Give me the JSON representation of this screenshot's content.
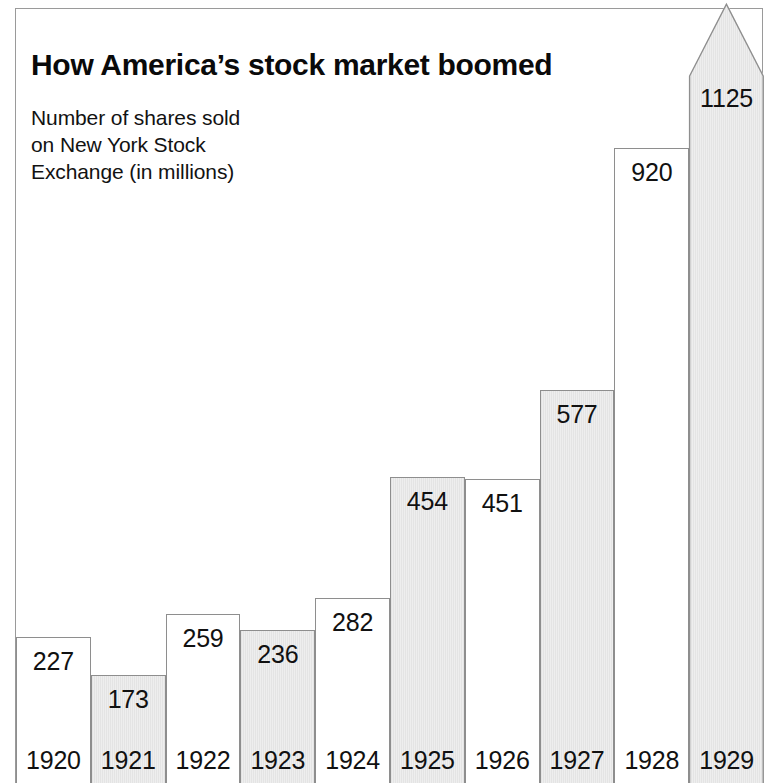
{
  "title": "How America’s stock market boomed",
  "subtitle_lines": [
    "Number of shares sold",
    "on New York Stock",
    "Exchange (in millions)"
  ],
  "colors": {
    "frame_border": "#9a9a9a",
    "bar_border": "#8e8e8e",
    "bar_light_fill": "#ffffff",
    "bar_shaded_fill": "#e9e9e9",
    "text": "#111111",
    "background": "#ffffff"
  },
  "chart_data": {
    "type": "bar",
    "title": "How America’s stock market boomed",
    "subtitle": "Number of shares sold on New York Stock Exchange (in millions)",
    "xlabel": "",
    "ylabel": "Number of shares sold (millions)",
    "ylim": [
      0,
      1125
    ],
    "grid": false,
    "legend": "none",
    "categories": [
      "1920",
      "1921",
      "1922",
      "1923",
      "1924",
      "1925",
      "1926",
      "1927",
      "1928",
      "1929"
    ],
    "values": [
      227,
      173,
      259,
      236,
      282,
      454,
      451,
      577,
      920,
      1125
    ],
    "value_labels": [
      "227",
      "173",
      "259",
      "236",
      "282",
      "454",
      "451",
      "577",
      "920",
      "1125"
    ],
    "annotations": [
      {
        "category": "1929",
        "note": "bar drawn with a pointed arrow-shaped top that breaks out of the chart frame"
      }
    ],
    "bars": [
      {
        "year": "1920",
        "value": 227,
        "label": "227",
        "fill": "light"
      },
      {
        "year": "1921",
        "value": 173,
        "label": "173",
        "fill": "shaded"
      },
      {
        "year": "1922",
        "value": 259,
        "label": "259",
        "fill": "light"
      },
      {
        "year": "1923",
        "value": 236,
        "label": "236",
        "fill": "shaded"
      },
      {
        "year": "1924",
        "value": 282,
        "label": "282",
        "fill": "light"
      },
      {
        "year": "1925",
        "value": 454,
        "label": "454",
        "fill": "shaded"
      },
      {
        "year": "1926",
        "value": 451,
        "label": "451",
        "fill": "light"
      },
      {
        "year": "1927",
        "value": 577,
        "label": "577",
        "fill": "shaded"
      },
      {
        "year": "1928",
        "value": 920,
        "label": "920",
        "fill": "light"
      },
      {
        "year": "1929",
        "value": 1125,
        "label": "1125",
        "fill": "shaded"
      }
    ]
  }
}
